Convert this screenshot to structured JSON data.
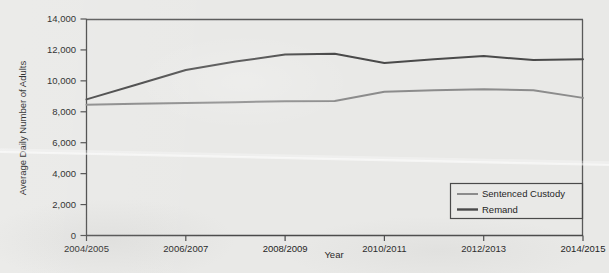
{
  "chart_data": {
    "type": "line",
    "title": "",
    "xlabel": "Year",
    "ylabel": "Average Daily Number of Adults",
    "x": [
      "2004/2005",
      "2005/2006",
      "2006/2007",
      "2007/2008",
      "2008/2009",
      "2009/2010",
      "2010/2011",
      "2011/2012",
      "2012/2013",
      "2013/2014",
      "2014/2015"
    ],
    "xtick_labels": [
      "2004/2005",
      "2006/2007",
      "2008/2009",
      "2010/2011",
      "2012/2013",
      "2014/2015"
    ],
    "ytick_labels": [
      "0",
      "2,000",
      "4,000",
      "6,000",
      "8,000",
      "10,000",
      "12,000",
      "14,000"
    ],
    "ytick_values": [
      0,
      2000,
      4000,
      6000,
      8000,
      10000,
      12000,
      14000
    ],
    "ylim": [
      0,
      14000
    ],
    "grid": false,
    "legend_position": "bottom-right",
    "series": [
      {
        "name": "Sentenced Custody",
        "color": "#8c8c8c",
        "values": [
          8450,
          8520,
          8570,
          8620,
          8680,
          8700,
          9300,
          9400,
          9450,
          9400,
          8900
        ]
      },
      {
        "name": "Remand",
        "color": "#4a4a4a",
        "values": [
          8800,
          9750,
          10700,
          11250,
          11700,
          11750,
          11150,
          11400,
          11600,
          11350,
          11400
        ]
      }
    ]
  },
  "legend": {
    "items": [
      {
        "label": "Sentenced Custody"
      },
      {
        "label": "Remand"
      }
    ]
  },
  "colors": {
    "background": "#e9e9e7",
    "axis": "#4a4a4a",
    "text": "#1f1f1f",
    "sentenced_custody": "#8c8c8c",
    "remand": "#4a4a4a"
  }
}
